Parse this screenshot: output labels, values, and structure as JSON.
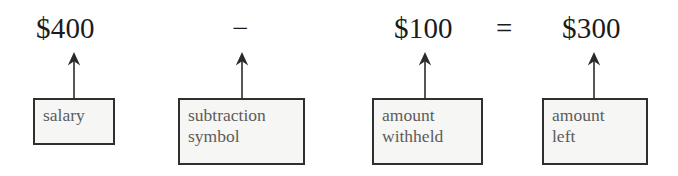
{
  "diagram": {
    "kind": "labelled-equation-diagram",
    "equation": {
      "terms": [
        {
          "id": "salary-amount",
          "text": "$400"
        },
        {
          "id": "withheld-amount",
          "text": "$100"
        },
        {
          "id": "remaining-amount",
          "text": "$300"
        }
      ],
      "operators": [
        {
          "id": "minus-operator",
          "text": "−"
        },
        {
          "id": "equals-operator",
          "text": "="
        }
      ]
    },
    "callouts": [
      {
        "id": "salary-callout",
        "line1": "salary",
        "line2": ""
      },
      {
        "id": "subtraction-symbol-callout",
        "line1": "subtraction",
        "line2": "symbol"
      },
      {
        "id": "amount-withheld-callout",
        "line1": "amount",
        "line2": "withheld"
      },
      {
        "id": "amount-left-callout",
        "line1": "amount",
        "line2": "left"
      }
    ],
    "arrows": [
      {
        "id": "arrow-to-salary",
        "direction": "up"
      },
      {
        "id": "arrow-to-subtraction-symbol",
        "direction": "up"
      },
      {
        "id": "arrow-to-amount-withheld",
        "direction": "up"
      },
      {
        "id": "arrow-to-amount-left",
        "direction": "up"
      }
    ],
    "colors": {
      "background": "#ffffff",
      "equation_text": "#1b1b1b",
      "box_fill": "#f6f6f4",
      "box_border": "#2f2f2f",
      "box_text": "#5c5c5c",
      "arrow": "#2b2b2b"
    }
  }
}
